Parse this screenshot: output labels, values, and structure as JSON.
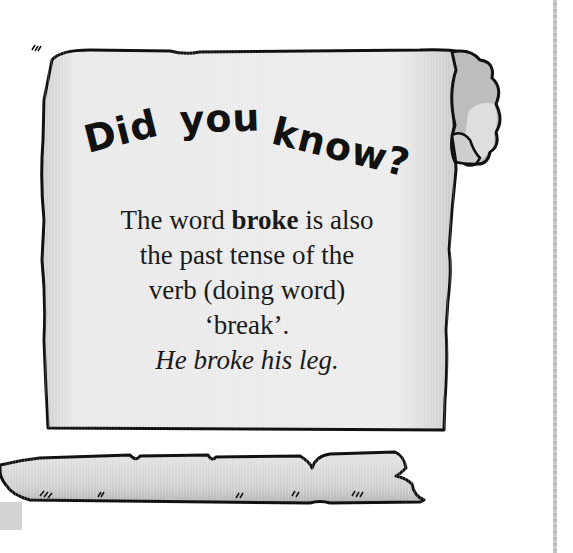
{
  "callout": {
    "heading": "Did you know?",
    "heading_parts": [
      "Did",
      "you",
      "know?"
    ],
    "lines": [
      {
        "before": "The word ",
        "bold": "broke",
        "after": " is also"
      },
      {
        "text": "the past tense of the"
      },
      {
        "text": "verb (doing word)"
      },
      {
        "text": "‘break’."
      }
    ],
    "example": "He broke his leg."
  },
  "colors": {
    "scroll_fill": "#e6e6e6",
    "scroll_shade": "#bdbdbd",
    "outline": "#111111",
    "page_edge": "#bbbbbb"
  }
}
